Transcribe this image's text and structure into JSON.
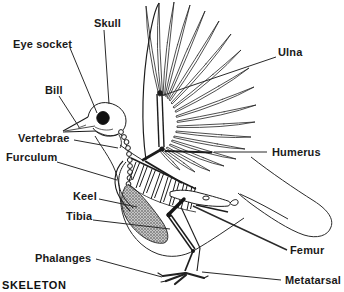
{
  "title": "SKELETON",
  "colors": {
    "ink": "#1a1a1a",
    "background": "#ffffff"
  },
  "labels": [
    {
      "id": "skull",
      "text": "Skull"
    },
    {
      "id": "eye-socket",
      "text": "Eye socket"
    },
    {
      "id": "bill",
      "text": "Bill"
    },
    {
      "id": "vertebrae",
      "text": "Vertebrae"
    },
    {
      "id": "furculum",
      "text": "Furculum"
    },
    {
      "id": "keel",
      "text": "Keel"
    },
    {
      "id": "tibia",
      "text": "Tibia"
    },
    {
      "id": "phalanges",
      "text": "Phalanges"
    },
    {
      "id": "ulna",
      "text": "Ulna"
    },
    {
      "id": "humerus",
      "text": "Humerus"
    },
    {
      "id": "femur",
      "text": "Femur"
    },
    {
      "id": "metatarsal",
      "text": "Metatarsal"
    }
  ]
}
